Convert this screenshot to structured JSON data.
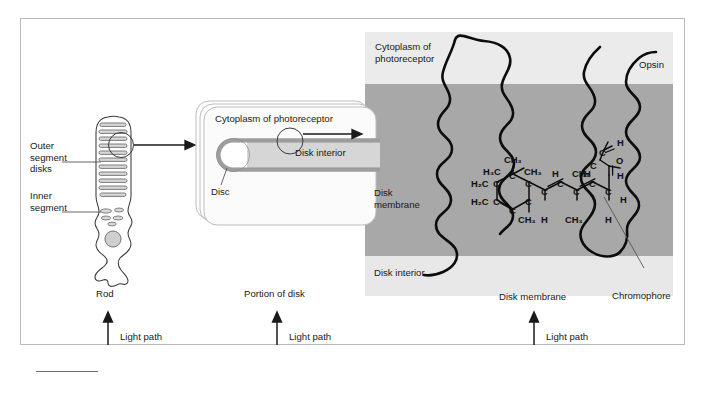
{
  "figure": {
    "domain": "Diagram"
  },
  "colors": {
    "panel_light": "#ebebeb",
    "membrane_band": "#a8a8a8",
    "disk_interior_band": "#e3e3e3",
    "outline": "#1a1a1a",
    "frame_border": "#b9b9b9",
    "disc_fill": "#d9d9d9",
    "disc_stroke": "#8c8c8c",
    "leader_line": "#555555",
    "background": "#ffffff"
  },
  "panel_rod": {
    "labels": {
      "outer_segment_disks": "Outer\nsegment\ndisks",
      "inner_segment": "Inner\nsegment",
      "caption": "Rod",
      "light_path": "Light path"
    }
  },
  "panel_disk": {
    "labels": {
      "cytoplasm": "Cytoplasm of photoreceptor",
      "disk_interior": "Disk interior",
      "disc": "Disc",
      "caption": "Portion of disk",
      "light_path": "Light path"
    }
  },
  "panel_molecule": {
    "labels": {
      "cytoplasm": "Cytoplasm of\nphotoreceptor",
      "opsin": "Opsin",
      "disk_membrane_left": "Disk\nmembrane",
      "disk_interior": "Disk interior",
      "disk_membrane_bottom": "Disk membrane",
      "chromophore": "Chromophore",
      "light_path": "Light path"
    },
    "chromophore_formula": {
      "name": "11-cis-retinal",
      "ring_groups": [
        "H3C",
        "CH3",
        "H2C",
        "H2C",
        "CH3"
      ],
      "chain_groups": [
        "CH3",
        "H",
        "CH3",
        "H",
        "CH3",
        "H",
        "H"
      ],
      "aldehyde_groups": [
        "C",
        "H",
        "O"
      ],
      "atoms": [
        {
          "id": "a1",
          "text": "H",
          "sub": "2",
          "tail": "C"
        },
        {
          "id": "a2",
          "text": "H",
          "sub": "2",
          "tail": "C"
        },
        {
          "id": "a3",
          "text": "CH",
          "sub": "3",
          "tail": ""
        },
        {
          "id": "a4",
          "text": "H",
          "sub": "2",
          "tail": "C"
        },
        {
          "id": "a5",
          "text": "CH",
          "sub": "3",
          "tail": ""
        },
        {
          "id": "a6",
          "text": "C",
          "sub": "",
          "tail": ""
        },
        {
          "id": "a7",
          "text": "C",
          "sub": "",
          "tail": ""
        },
        {
          "id": "a8",
          "text": "C",
          "sub": "",
          "tail": ""
        },
        {
          "id": "a9",
          "text": "CH",
          "sub": "3",
          "tail": ""
        },
        {
          "id": "a10",
          "text": "C",
          "sub": "",
          "tail": ""
        },
        {
          "id": "a11",
          "text": "H",
          "sub": "",
          "tail": ""
        },
        {
          "id": "a12",
          "text": "C",
          "sub": "",
          "tail": ""
        },
        {
          "id": "a13",
          "text": "H",
          "sub": "",
          "tail": ""
        },
        {
          "id": "a14",
          "text": "C",
          "sub": "",
          "tail": ""
        },
        {
          "id": "a15",
          "text": "CH",
          "sub": "3",
          "tail": ""
        },
        {
          "id": "a16",
          "text": "C",
          "sub": "",
          "tail": ""
        },
        {
          "id": "a17",
          "text": "H",
          "sub": "",
          "tail": ""
        },
        {
          "id": "a18",
          "text": "C",
          "sub": "",
          "tail": ""
        },
        {
          "id": "a19",
          "text": "H",
          "sub": "",
          "tail": ""
        },
        {
          "id": "a20",
          "text": "CH",
          "sub": "3",
          "tail": ""
        },
        {
          "id": "a21",
          "text": "C",
          "sub": "",
          "tail": ""
        },
        {
          "id": "a22",
          "text": "C",
          "sub": "",
          "tail": ""
        },
        {
          "id": "a23",
          "text": "H",
          "sub": "",
          "tail": ""
        },
        {
          "id": "a24",
          "text": "C",
          "sub": "",
          "tail": ""
        },
        {
          "id": "a25",
          "text": "H",
          "sub": "",
          "tail": ""
        },
        {
          "id": "a26",
          "text": "O",
          "sub": "",
          "tail": ""
        },
        {
          "id": "a27",
          "text": "H",
          "sub": "",
          "tail": ""
        }
      ]
    }
  },
  "chem_text": {
    "h2c_a": "H₂C",
    "h2c_b": "H₂C",
    "h3c": "H₃C",
    "ch3_top": "CH₃",
    "ch3_ringright": "CH₃",
    "ch3_ringbottom": "CH₃",
    "ch3_chain1": "CH₃",
    "ch3_chain2": "CH₃",
    "ch3_chain3": "CH₃",
    "c": "C",
    "h": "H",
    "o": "O"
  }
}
